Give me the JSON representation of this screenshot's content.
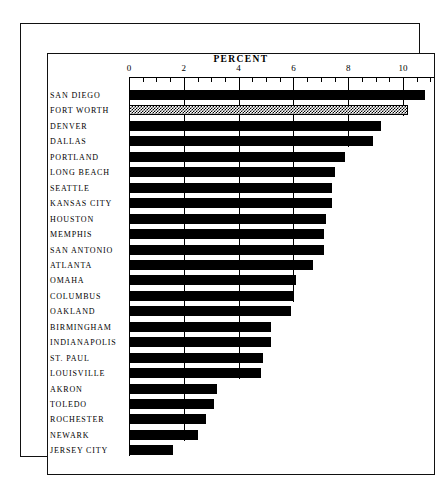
{
  "chart_data": {
    "type": "bar",
    "orientation": "horizontal",
    "title": "PERCENT",
    "xlabel": "PERCENT",
    "ylabel": "",
    "xlim": [
      0,
      11
    ],
    "grid": true,
    "legend": null,
    "xticks": [
      0,
      2,
      4,
      6,
      8,
      10
    ],
    "xtick_labels": [
      "0",
      "2",
      "4",
      "6",
      "8",
      "10"
    ],
    "minor_tick_step": 0.5,
    "highlight_category": "FORT WORTH",
    "highlight_style": "hatched",
    "categories": [
      "SAN DIEGO",
      "FORT WORTH",
      "DENVER",
      "DALLAS",
      "PORTLAND",
      "LONG BEACH",
      "SEATTLE",
      "KANSAS CITY",
      "HOUSTON",
      "MEMPHIS",
      "SAN ANTONIO",
      "ATLANTA",
      "OMAHA",
      "COLUMBUS",
      "OAKLAND",
      "BIRMINGHAM",
      "INDIANAPOLIS",
      "ST. PAUL",
      "LOUISVILLE",
      "AKRON",
      "TOLEDO",
      "ROCHESTER",
      "NEWARK",
      "JERSEY CITY"
    ],
    "values": [
      10.8,
      10.1,
      9.2,
      8.9,
      7.9,
      7.5,
      7.4,
      7.4,
      7.2,
      7.1,
      7.1,
      6.7,
      6.1,
      6.0,
      5.9,
      5.2,
      5.2,
      4.9,
      4.8,
      3.2,
      3.1,
      2.8,
      2.5,
      1.6
    ],
    "bars": [
      {
        "label": "SAN DIEGO",
        "value": 10.8,
        "style": "solid"
      },
      {
        "label": "FORT WORTH",
        "value": 10.1,
        "style": "hatched"
      },
      {
        "label": "DENVER",
        "value": 9.2,
        "style": "solid"
      },
      {
        "label": "DALLAS",
        "value": 8.9,
        "style": "solid"
      },
      {
        "label": "PORTLAND",
        "value": 7.9,
        "style": "solid"
      },
      {
        "label": "LONG BEACH",
        "value": 7.5,
        "style": "solid"
      },
      {
        "label": "SEATTLE",
        "value": 7.4,
        "style": "solid"
      },
      {
        "label": "KANSAS CITY",
        "value": 7.4,
        "style": "solid"
      },
      {
        "label": "HOUSTON",
        "value": 7.2,
        "style": "solid"
      },
      {
        "label": "MEMPHIS",
        "value": 7.1,
        "style": "solid"
      },
      {
        "label": "SAN ANTONIO",
        "value": 7.1,
        "style": "solid"
      },
      {
        "label": "ATLANTA",
        "value": 6.7,
        "style": "solid"
      },
      {
        "label": "OMAHA",
        "value": 6.1,
        "style": "solid"
      },
      {
        "label": "COLUMBUS",
        "value": 6.0,
        "style": "solid"
      },
      {
        "label": "OAKLAND",
        "value": 5.9,
        "style": "solid"
      },
      {
        "label": "BIRMINGHAM",
        "value": 5.2,
        "style": "solid"
      },
      {
        "label": "INDIANAPOLIS",
        "value": 5.2,
        "style": "solid"
      },
      {
        "label": "ST. PAUL",
        "value": 4.9,
        "style": "solid"
      },
      {
        "label": "LOUISVILLE",
        "value": 4.8,
        "style": "solid"
      },
      {
        "label": "AKRON",
        "value": 3.2,
        "style": "solid"
      },
      {
        "label": "TOLEDO",
        "value": 3.1,
        "style": "solid"
      },
      {
        "label": "ROCHESTER",
        "value": 2.8,
        "style": "solid"
      },
      {
        "label": "NEWARK",
        "value": 2.5,
        "style": "solid"
      },
      {
        "label": "JERSEY CITY",
        "value": 1.6,
        "style": "solid"
      }
    ],
    "colors": {
      "bar": "#000000",
      "highlight_fill": "#ffffff",
      "highlight_pattern": "#000000",
      "axis": "#000000",
      "grid": "#000000",
      "background": "#ffffff"
    }
  }
}
